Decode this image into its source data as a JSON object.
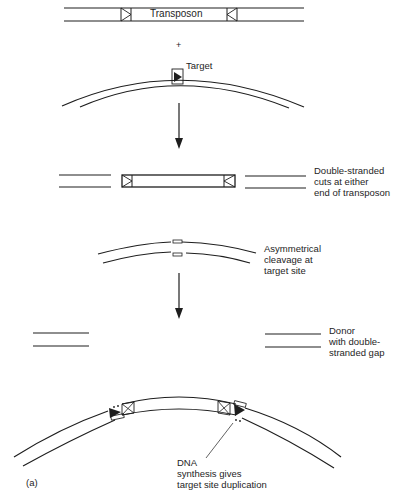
{
  "diagram": {
    "panel_label": "(a)",
    "step1": {
      "transposon_label": "Transposon",
      "plus_sign": "+",
      "target_label": "Target"
    },
    "step2": {
      "caption_lines": [
        "Double-stranded",
        "cuts at either",
        "end of transposon"
      ]
    },
    "step3": {
      "caption_lines": [
        "Asymmetrical",
        "cleavage at",
        "target site"
      ]
    },
    "step4": {
      "caption_lines": [
        "Donor",
        "with double-",
        "stranded gap"
      ]
    },
    "step5": {
      "caption_lines": [
        "DNA",
        "synthesis gives",
        "target site duplication"
      ]
    },
    "colors": {
      "ink": "#1e1e1e",
      "background": "#ffffff"
    }
  }
}
